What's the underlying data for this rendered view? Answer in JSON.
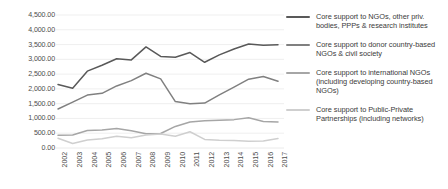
{
  "chart_data": {
    "type": "line",
    "title": "",
    "xlabel": "",
    "ylabel": "",
    "grid": true,
    "legend_position": "right",
    "ylim": [
      0,
      4500
    ],
    "ytick_labels": [
      "4,500.00",
      "4,000.00",
      "3,500.00",
      "3,000.00",
      "2,500.00",
      "2,000.00",
      "1,500.00",
      "1,000.00",
      "500.00",
      "0.00"
    ],
    "ytick_values": [
      4500,
      4000,
      3500,
      3000,
      2500,
      2000,
      1500,
      1000,
      500,
      0
    ],
    "categories": [
      "2002",
      "2003",
      "2004",
      "2005",
      "2006",
      "2007",
      "2008",
      "2009",
      "2010",
      "2011",
      "2012",
      "2013",
      "2014",
      "2015",
      "2016",
      "2017"
    ],
    "series": [
      {
        "name": "Core support to NGOs, other priv. bodies, PPPs & research institutes",
        "color": "#595959",
        "values": [
          2150,
          2020,
          2600,
          2800,
          3020,
          2980,
          3420,
          3100,
          3070,
          3230,
          2900,
          3150,
          3350,
          3520,
          3480,
          3490
        ]
      },
      {
        "name": "Core support to donor country-based NGOs & civil society",
        "color": "#808080",
        "values": [
          1320,
          1550,
          1790,
          1850,
          2100,
          2280,
          2530,
          2340,
          1570,
          1500,
          1520,
          1800,
          2060,
          2330,
          2420,
          2260
        ]
      },
      {
        "name": "Core support to international NGOs (including developing country-based NGOs)",
        "color": "#a6a6a6",
        "values": [
          430,
          440,
          590,
          610,
          660,
          580,
          480,
          490,
          730,
          880,
          920,
          940,
          960,
          1020,
          900,
          880
        ]
      },
      {
        "name": "Core support to Public-Private Partnerships (including networks)",
        "color": "#cfcfcf",
        "values": [
          330,
          150,
          270,
          310,
          400,
          350,
          440,
          470,
          400,
          550,
          290,
          260,
          250,
          230,
          240,
          320
        ]
      }
    ]
  },
  "legend": {
    "items": [
      {
        "label": "Core support to NGOs, other priv. bodies, PPPs & research institutes",
        "color": "#595959"
      },
      {
        "label": "Core support to donor country-based NGOs & civil society",
        "color": "#808080"
      },
      {
        "label": "Core support to international NGOs (including developing country-based NGOs)",
        "color": "#a6a6a6"
      },
      {
        "label": "Core support to Public-Private Partnerships (including networks)",
        "color": "#cfcfcf"
      }
    ]
  },
  "style": {
    "grid_color": "#e8e8e8",
    "axis_text_color": "#4d4d4d",
    "background": "#ffffff"
  }
}
